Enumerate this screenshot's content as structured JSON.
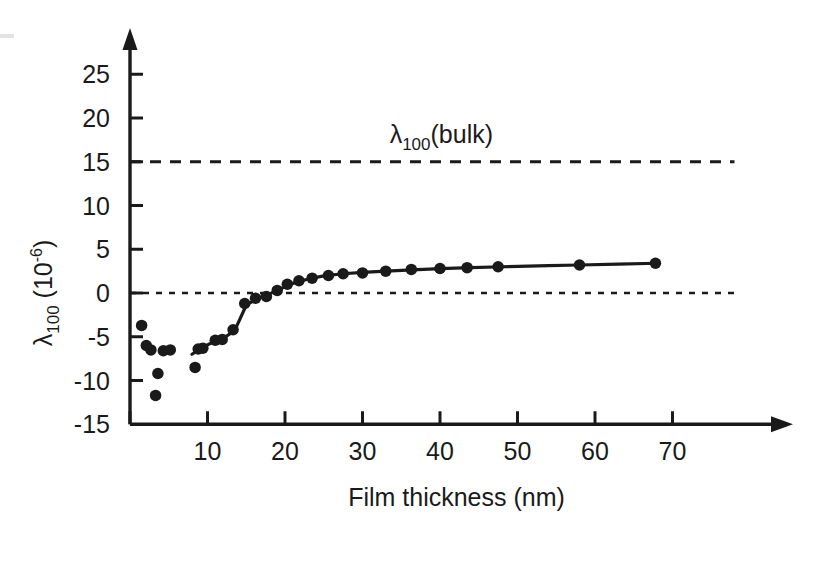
{
  "figure": {
    "background_color": "#ffffff",
    "ink_color": "#1a1a1a"
  },
  "axes": {
    "x": {
      "title": "Film thickness (nm)",
      "ticks": [
        0,
        10,
        20,
        30,
        40,
        50,
        60,
        70
      ],
      "tick_labels": [
        "",
        "10",
        "20",
        "30",
        "40",
        "50",
        "60",
        "70"
      ],
      "range": [
        0,
        72
      ],
      "arrow": true
    },
    "y": {
      "title_main": "λ",
      "title_sub": "100",
      "title_unit_open": " (10",
      "title_unit_exp": "-6",
      "title_unit_close": ")",
      "title_plain": "λ100 (10-6)",
      "ticks": [
        -15,
        -10,
        -5,
        0,
        5,
        10,
        15,
        20,
        25
      ],
      "tick_labels": [
        "-15",
        "-10",
        "-5",
        "0",
        "5",
        "10",
        "15",
        "20",
        "25"
      ],
      "range": [
        -15,
        28
      ],
      "arrow": true
    }
  },
  "annotations": [
    {
      "name": "bulk-label",
      "text_main": "λ",
      "text_sub": "100",
      "text_tail": "(bulk)",
      "text_plain": "λ100(bulk)",
      "x": 33.5,
      "y": 17.2
    }
  ],
  "reference_lines": [
    {
      "name": "bulk-line",
      "value": 15,
      "style": "dashed",
      "x_start": 0,
      "x_end": 78
    },
    {
      "name": "zero-line",
      "value": 0,
      "style": "dashed-fine",
      "x_start": 0,
      "x_end": 78.5
    }
  ],
  "chart_data": {
    "type": "scatter",
    "title": "",
    "xlabel": "Film thickness (nm)",
    "ylabel": "λ100 (10-6)",
    "xlim": [
      0,
      72
    ],
    "ylim": [
      -15,
      28
    ],
    "grid": false,
    "legend": null,
    "marker": {
      "shape": "circle",
      "size_px": 11.5,
      "color": "#1a1a1a"
    },
    "series": [
      {
        "name": "lambda_100 vs film thickness",
        "points": [
          [
            1.5,
            -3.7
          ],
          [
            2.1,
            -6.0
          ],
          [
            2.7,
            -6.5
          ],
          [
            3.3,
            -11.7
          ],
          [
            3.6,
            -9.2
          ],
          [
            4.3,
            -6.6
          ],
          [
            5.2,
            -6.5
          ],
          [
            8.4,
            -8.5
          ],
          [
            8.8,
            -6.4
          ],
          [
            9.4,
            -6.3
          ],
          [
            11.0,
            -5.4
          ],
          [
            11.9,
            -5.3
          ],
          [
            13.3,
            -4.2
          ],
          [
            14.8,
            -1.2
          ],
          [
            16.2,
            -0.6
          ],
          [
            17.6,
            -0.4
          ],
          [
            19.0,
            0.3
          ],
          [
            20.3,
            1.0
          ],
          [
            21.8,
            1.4
          ],
          [
            23.5,
            1.7
          ],
          [
            25.6,
            2.0
          ],
          [
            27.5,
            2.2
          ],
          [
            30.0,
            2.3
          ],
          [
            33.0,
            2.5
          ],
          [
            36.3,
            2.7
          ],
          [
            40.0,
            2.8
          ],
          [
            43.5,
            2.9
          ],
          [
            47.5,
            3.0
          ],
          [
            58.0,
            3.2
          ],
          [
            67.8,
            3.4
          ]
        ]
      }
    ],
    "fit_curve": {
      "name": "guide-curve",
      "style": "solid",
      "points": [
        [
          8.0,
          -7.0
        ],
        [
          9.0,
          -6.4
        ],
        [
          10.5,
          -5.7
        ],
        [
          12.0,
          -5.2
        ],
        [
          13.5,
          -4.3
        ],
        [
          15.0,
          -1.4
        ],
        [
          16.5,
          -0.6
        ],
        [
          18.0,
          -0.1
        ],
        [
          19.5,
          0.5
        ],
        [
          21.0,
          1.1
        ],
        [
          23.0,
          1.6
        ],
        [
          25.0,
          1.95
        ],
        [
          27.5,
          2.2
        ],
        [
          30.0,
          2.35
        ],
        [
          33.0,
          2.5
        ],
        [
          36.5,
          2.65
        ],
        [
          40.0,
          2.78
        ],
        [
          44.0,
          2.9
        ],
        [
          48.0,
          3.0
        ],
        [
          54.0,
          3.12
        ],
        [
          58.0,
          3.2
        ],
        [
          63.0,
          3.3
        ],
        [
          68.0,
          3.4
        ]
      ]
    }
  }
}
